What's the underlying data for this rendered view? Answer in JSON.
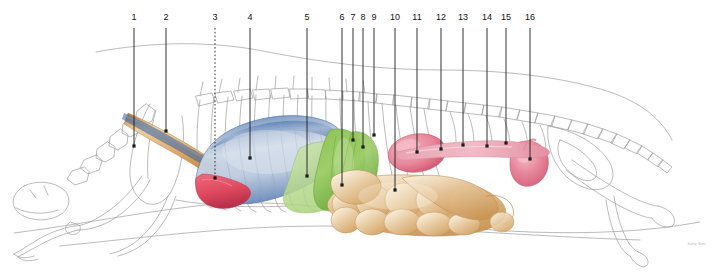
{
  "figure": {
    "kind": "veterinary-anatomy-lateral-illustration",
    "background_color": "#ffffff",
    "skeleton_line_color": "#9a9a9a",
    "body_outline_color": "#8c8c8c",
    "leader_line_color": "#1c1c1c",
    "label_text_color": "#111111"
  },
  "signature": {
    "text": "Kathy West",
    "color": "#b9b9b9"
  },
  "palette": {
    "lung_fill": "#c6d2e2",
    "lung_rim": "#2f63a6",
    "lung_deep": "#3a6fae",
    "heart_red": "#e04a5f",
    "liver_green": "#7ab648",
    "liver_green_light": "#b9d98e",
    "kidney_pink": "#e8889c",
    "kidney_pink_deep": "#d9566f",
    "intestine_tan": "#d9a86c",
    "intestine_light": "#f2e2c8",
    "trachea_tan": "#d9a05a",
    "trachea_light": "#f0d3a8"
  },
  "labels": [
    {
      "n": "1",
      "x": 134,
      "y": 18,
      "tip_x": 134,
      "tip_y": 146,
      "style": "solid"
    },
    {
      "n": "2",
      "x": 166,
      "y": 18,
      "tip_x": 166,
      "tip_y": 131,
      "style": "solid"
    },
    {
      "n": "3",
      "x": 215,
      "y": 18,
      "tip_x": 215,
      "tip_y": 178,
      "style": "dotted"
    },
    {
      "n": "4",
      "x": 250,
      "y": 18,
      "tip_x": 250,
      "tip_y": 158,
      "style": "solid"
    },
    {
      "n": "5",
      "x": 307,
      "y": 18,
      "tip_x": 307,
      "tip_y": 176,
      "style": "solid"
    },
    {
      "n": "6",
      "x": 342,
      "y": 18,
      "tip_x": 342,
      "tip_y": 185,
      "style": "solid"
    },
    {
      "n": "7",
      "x": 353,
      "y": 18,
      "tip_x": 353,
      "tip_y": 140,
      "style": "solid"
    },
    {
      "n": "8",
      "x": 363,
      "y": 18,
      "tip_x": 363,
      "tip_y": 147,
      "style": "solid"
    },
    {
      "n": "9",
      "x": 374,
      "y": 18,
      "tip_x": 374,
      "tip_y": 135,
      "style": "solid"
    },
    {
      "n": "10",
      "x": 395,
      "y": 18,
      "tip_x": 395,
      "tip_y": 190,
      "style": "solid"
    },
    {
      "n": "11",
      "x": 417,
      "y": 18,
      "tip_x": 417,
      "tip_y": 152,
      "style": "solid"
    },
    {
      "n": "12",
      "x": 441,
      "y": 18,
      "tip_x": 441,
      "tip_y": 149,
      "style": "solid"
    },
    {
      "n": "13",
      "x": 463,
      "y": 18,
      "tip_x": 463,
      "tip_y": 145,
      "style": "solid"
    },
    {
      "n": "14",
      "x": 487,
      "y": 18,
      "tip_x": 487,
      "tip_y": 146,
      "style": "solid"
    },
    {
      "n": "15",
      "x": 506,
      "y": 18,
      "tip_x": 506,
      "tip_y": 143,
      "style": "solid"
    },
    {
      "n": "16",
      "x": 530,
      "y": 18,
      "tip_x": 530,
      "tip_y": 159,
      "style": "solid"
    }
  ]
}
